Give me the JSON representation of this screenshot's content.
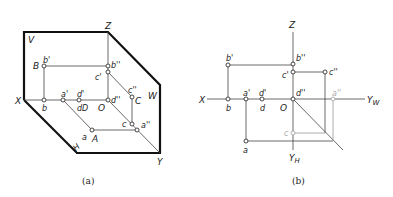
{
  "figure_a": {
    "caption": "(a)",
    "planes": {
      "V": "V",
      "W": "W",
      "H": "H"
    },
    "axes": {
      "X": "X",
      "Y": "Y",
      "Z": "Z",
      "O": "O"
    },
    "points": {
      "B": "B",
      "b_prime": "b'",
      "b": "b",
      "b_dprime": "b''",
      "a_prime": "a'",
      "a": "a",
      "A": "A",
      "a_dprime": "a''",
      "d_prime": "d'",
      "dD": "dD",
      "d_dprime": "d''",
      "c_prime": "c'",
      "c_dprime": "c''",
      "C": "C",
      "c": "c"
    }
  },
  "figure_b": {
    "caption": "(b)",
    "axes": {
      "X": "X",
      "Z": "Z",
      "O": "O",
      "YW": "Y",
      "YW_sub": "W",
      "YH": "Y",
      "YH_sub": "H"
    },
    "points": {
      "b_prime": "b'",
      "b": "b",
      "b_dprime": "b''",
      "a_prime": "a'",
      "a": "a",
      "a_dprime": "a''",
      "d_prime": "d'",
      "d": "d",
      "d_dprime": "d''",
      "c_prime": "c'",
      "c_dprime": "c''",
      "c": "c"
    }
  }
}
